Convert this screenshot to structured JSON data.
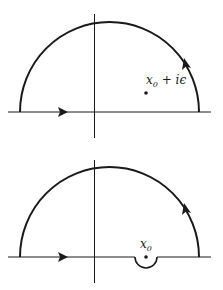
{
  "diagrams": [
    {
      "name": "contour-with-shifted-pole",
      "pole_label": {
        "base": "x",
        "sub": "0",
        "rest": " + iϵ"
      },
      "description": "Semicircular contour closed in upper half-plane with pole shifted above real axis"
    },
    {
      "name": "contour-with-indentation",
      "pole_label": {
        "base": "x",
        "sub": "0",
        "rest": ""
      },
      "description": "Semicircular contour with small semicircular detour below pole on real axis"
    }
  ],
  "colors": {
    "line": "#1a1a1a",
    "background": "#ffffff"
  }
}
